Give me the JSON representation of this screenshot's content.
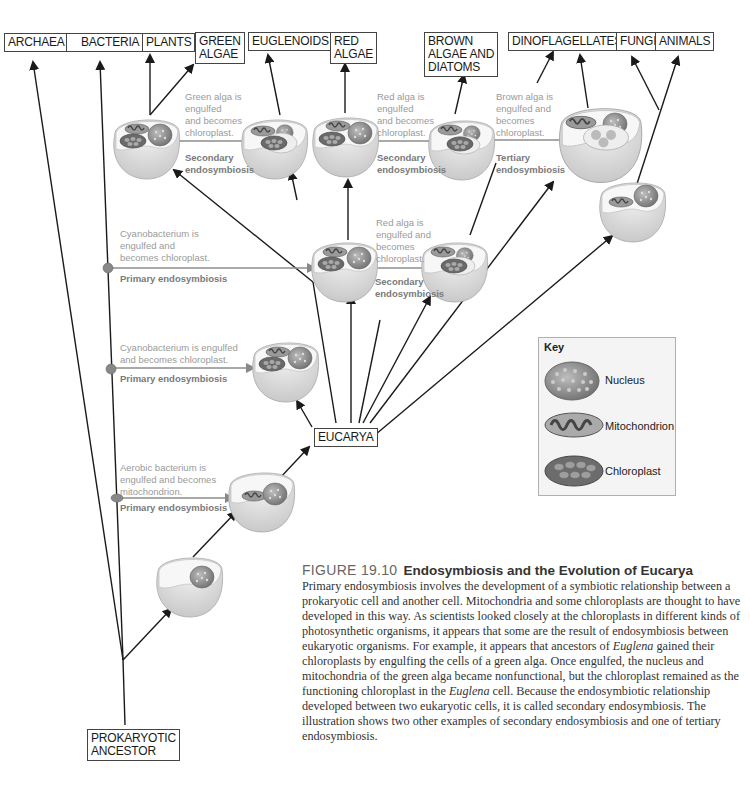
{
  "figure": {
    "number": "FIGURE 19.10",
    "title": "Endosymbiosis and the Evolution of Eucarya",
    "caption_parts": [
      {
        "text": "Primary endosymbiosis involves the development of a symbiotic relationship between a prokaryotic cell and another cell. Mitochondria and some chloroplasts are thought to have developed in this way. As scientists looked closely at the chloroplasts in different kinds of photosynthetic organisms, it appears that some are the result of endosymbiosis between eukaryotic organisms. For example, it appears that ancestors of ",
        "italic": false
      },
      {
        "text": "Euglena",
        "italic": true
      },
      {
        "text": " gained their chloroplasts by engulfing the cells of a green alga. Once engulfed, the nucleus and mitochondria of the green alga became nonfunctional, but the chloroplast remained as the functioning chloroplast in the ",
        "italic": false
      },
      {
        "text": "Euglena",
        "italic": true
      },
      {
        "text": " cell. Because the endosymbiotic relationship developed between two eukaryotic cells, it is called secondary endosymbiosis. The illustration shows two other examples of secondary endosymbiosis and one of tertiary endosymbiosis.",
        "italic": false
      }
    ]
  },
  "taxa": {
    "archaea": "ARCHAEA",
    "bacteria": "BACTERIA",
    "plants": "PLANTS",
    "green_algae": "GREEN\nALGAE",
    "euglenoids": "EUGLENOIDS",
    "red_algae": "RED\nALGAE",
    "brown_algae_diatoms": "BROWN\nALGAE AND\nDIATOMS",
    "dinoflagellates": "DINOFLAGELLATES",
    "fungi": "FUNGI",
    "animals": "ANIMALS",
    "eucarya": "EUCARYA",
    "prokaryotic_ancestor": "PROKARYOTIC\nANCESTOR"
  },
  "notes": {
    "green_alga": "Green alga is\nengulfed\nand becomes\nchloroplast.",
    "red_alga_top": "Red alga is\nengulfed\nand becomes\nchloroplast.",
    "brown_alga": "Brown alga is\nengulfed and\nbecomes\nchloroplast.",
    "cyanobacterium_1": "Cyanobacterium is\nengulfed and\nbecomes chloroplast.",
    "red_alga_mid": "Red alga is\nengulfed and\nbecomes\nchloroplast.",
    "cyanobacterium_2": "Cyanobacterium is engulfed\nand becomes chloroplast.",
    "aerobic_bacterium": "Aerobic bacterium is\nengulfed and becomes\nmitochondrion."
  },
  "stages": {
    "secondary_1": "Secondary\nendosymbiosis",
    "secondary_2": "Secondary\nendosymbiosis",
    "tertiary": "Tertiary\nendosymbiosis",
    "primary_1": "Primary endosymbiosis",
    "secondary_3": "Secondary\nendosymbiosis",
    "primary_2": "Primary endosymbiosis",
    "primary_3": "Primary endosymbiosis"
  },
  "key": {
    "title": "Key",
    "items": [
      {
        "label": "Nucleus",
        "icon": "nucleus-icon"
      },
      {
        "label": "Mitochondrion",
        "icon": "mitochondrion-icon"
      },
      {
        "label": "Chloroplast",
        "icon": "chloroplast-icon"
      }
    ]
  },
  "colors": {
    "line": "#1a1a1a",
    "note_text": "#9a9a9a",
    "stage_text": "#7a7a7a",
    "cell_body": "#e3e3e3",
    "cell_inner": "#f5f5f5",
    "organelle": "#808080"
  }
}
